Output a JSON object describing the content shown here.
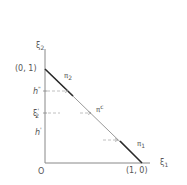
{
  "diagram": {
    "type": "simplex-line-plot",
    "axes": {
      "y_label": "ξ",
      "y_label_sub": "2",
      "x_label": "ξ",
      "x_label_sub": "1",
      "origin_label": "O"
    },
    "points": {
      "top": "(0, 1)",
      "right": "(1, 0)"
    },
    "y_ticks": [
      {
        "label": "h",
        "sup": "\"",
        "italic": true
      },
      {
        "label": "ξ",
        "sup": "'",
        "sub": "2",
        "italic": false
      },
      {
        "label": "h",
        "sup": "'",
        "italic": true
      }
    ],
    "line_labels": {
      "pi2": {
        "base": "π",
        "sub": "2"
      },
      "pic": {
        "base": "π",
        "sup": "c"
      },
      "pi1": {
        "base": "π",
        "sub": "1"
      }
    },
    "colors": {
      "line": "#9a9a9a",
      "heavy_segment": "#2a2a2a",
      "axis": "#888888",
      "dashed": "#b0b0b0",
      "text": "#555555"
    }
  }
}
